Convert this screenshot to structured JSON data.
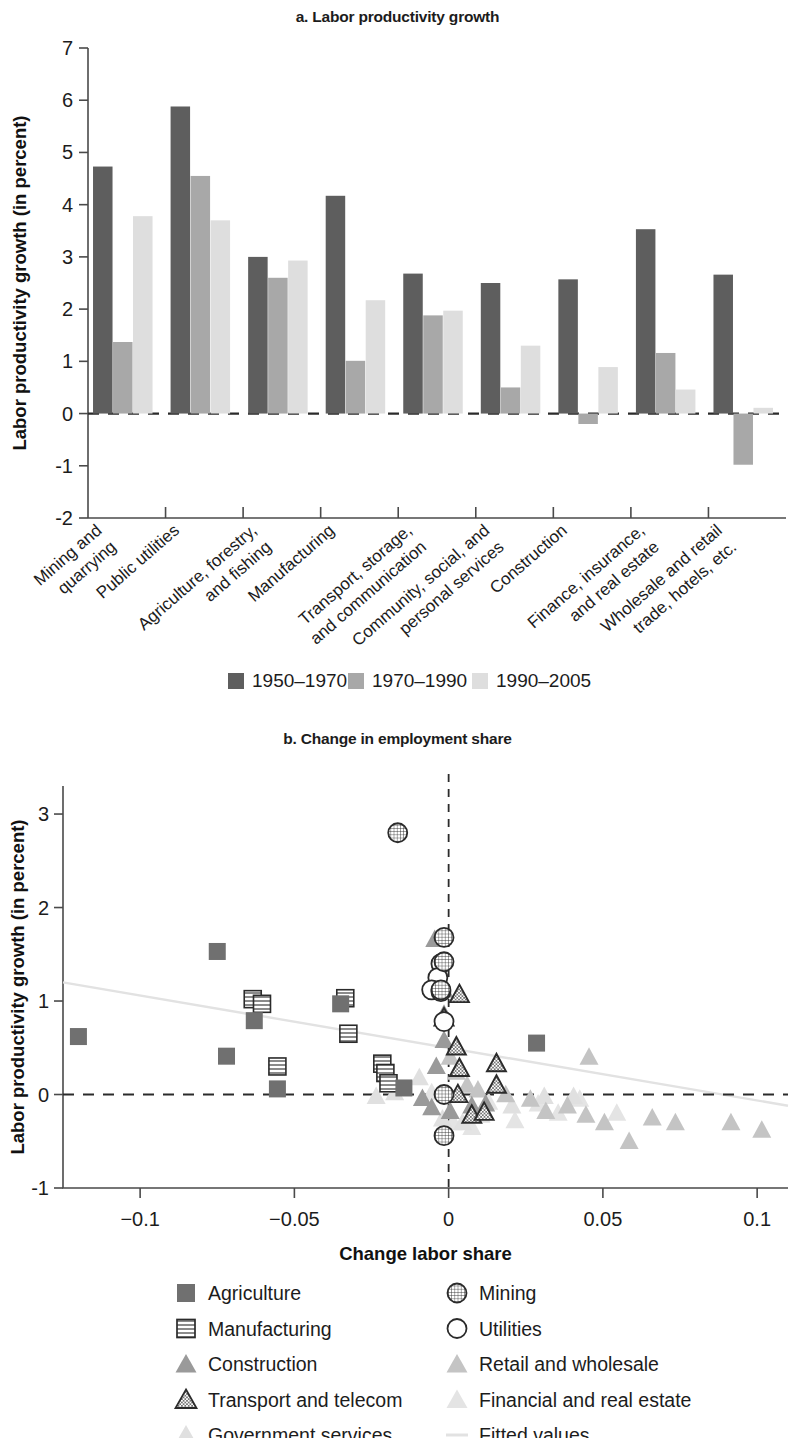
{
  "panel_a": {
    "title": "a. Labor productivity growth",
    "ylabel": "Labor productivity growth (in percent)",
    "yticks": [
      "7",
      "6",
      "5",
      "4",
      "3",
      "2",
      "1",
      "0",
      "-1",
      "-2"
    ],
    "legend": [
      {
        "label": "1950–1970",
        "color": "#5e5e5e"
      },
      {
        "label": "1970–1990",
        "color": "#a8a8a8"
      },
      {
        "label": "1990–2005",
        "color": "#dedede"
      }
    ]
  },
  "panel_b": {
    "title": "b. Change in employment share",
    "ylabel": "Labor productivity growth (in percent)",
    "xlabel": "Change labor share",
    "yticks": [
      "3",
      "2",
      "1",
      "0",
      "-1"
    ],
    "xticks": [
      "−0.1",
      "−0.05",
      "0",
      "0.05",
      "0.1"
    ],
    "legend_left": [
      {
        "label": "Agriculture",
        "marker": "filled-square",
        "color": "#707070"
      },
      {
        "label": "Manufacturing",
        "marker": "lined-square",
        "color": "#2b2b2b"
      },
      {
        "label": "Construction",
        "marker": "filled-triangle",
        "color": "#9a9a9a"
      },
      {
        "label": "Transport and telecom",
        "marker": "outline-triangle",
        "color": "#2b2b2b"
      },
      {
        "label": "Government services",
        "marker": "faint-triangle",
        "color": "#e0e0e0"
      }
    ],
    "legend_right": [
      {
        "label": "Mining",
        "marker": "globe-circle",
        "color": "#2b2b2b"
      },
      {
        "label": "Utilities",
        "marker": "open-circle",
        "color": "#2b2b2b"
      },
      {
        "label": "Retail and wholesale",
        "marker": "light-triangle",
        "color": "#c4c4c4"
      },
      {
        "label": "Financial and real estate",
        "marker": "faint-triangle",
        "color": "#e4e4e4"
      },
      {
        "label": "Fitted values",
        "marker": "line",
        "color": "#e2e2e2"
      }
    ]
  },
  "chart_data": [
    {
      "type": "bar",
      "title": "a. Labor productivity growth",
      "xlabel": "",
      "ylabel": "Labor productivity growth (in percent)",
      "ylim": [
        -2,
        7
      ],
      "grid": false,
      "legend_position": "bottom",
      "categories": [
        "Mining and quarrying",
        "Public utilities",
        "Agriculture, forestry, and fishing",
        "Manufacturing",
        "Transport, storage, and communication",
        "Community, social, and personal services",
        "Construction",
        "Finance, insurance, and real estate",
        "Wholesale and retail trade, hotels, etc."
      ],
      "series": [
        {
          "name": "1950–1970",
          "color": "#5e5e5e",
          "values": [
            4.73,
            5.88,
            3.0,
            4.17,
            2.68,
            2.5,
            2.57,
            3.53,
            2.66
          ]
        },
        {
          "name": "1970–1990",
          "color": "#a8a8a8",
          "values": [
            1.37,
            4.55,
            2.6,
            1.01,
            1.88,
            0.5,
            -0.2,
            1.16,
            -0.98
          ]
        },
        {
          "name": "1990–2005",
          "color": "#dedede",
          "values": [
            3.78,
            3.7,
            2.93,
            2.17,
            1.97,
            1.3,
            0.89,
            0.46,
            0.11
          ]
        }
      ]
    },
    {
      "type": "scatter",
      "title": "b. Change in employment share",
      "xlabel": "Change labor share",
      "ylabel": "Labor productivity growth (in percent)",
      "xlim": [
        -0.125,
        0.11
      ],
      "ylim": [
        -1.0,
        3.3
      ],
      "grid": false,
      "legend_position": "bottom",
      "annotations": [
        "horizontal dashed line at y=0",
        "vertical dashed line at x=0"
      ],
      "fitted_line": {
        "name": "Fitted values",
        "x": [
          -0.125,
          0.11
        ],
        "y": [
          1.2,
          -0.12
        ],
        "color": "#e2e2e2"
      },
      "series": [
        {
          "name": "Agriculture",
          "marker": "filled-square",
          "color": "#707070",
          "points": [
            [
              -0.12,
              0.62
            ],
            [
              -0.075,
              1.53
            ],
            [
              -0.072,
              0.41
            ],
            [
              -0.063,
              0.79
            ],
            [
              -0.0555,
              0.06
            ],
            [
              -0.035,
              0.97
            ],
            [
              -0.0145,
              0.07
            ],
            [
              0.0285,
              0.55
            ]
          ]
        },
        {
          "name": "Manufacturing",
          "marker": "lined-square",
          "color": "#2b2b2b",
          "points": [
            [
              -0.0635,
              1.02
            ],
            [
              -0.0605,
              0.97
            ],
            [
              -0.0555,
              0.3
            ],
            [
              -0.0335,
              1.03
            ],
            [
              -0.0325,
              0.65
            ],
            [
              -0.0215,
              0.33
            ],
            [
              -0.0205,
              0.23
            ],
            [
              -0.0195,
              0.12
            ]
          ]
        },
        {
          "name": "Construction",
          "marker": "filled-triangle",
          "color": "#9a9a9a",
          "points": [
            [
              -0.0045,
              1.66
            ],
            [
              -0.0015,
              1.12
            ],
            [
              -0.0015,
              0.86
            ],
            [
              -0.0015,
              0.58
            ],
            [
              -0.004,
              0.3
            ],
            [
              -0.0085,
              -0.04
            ],
            [
              -0.0055,
              -0.14
            ],
            [
              0.0005,
              -0.18
            ],
            [
              0.0075,
              -0.12
            ],
            [
              0.012,
              -0.1
            ]
          ]
        },
        {
          "name": "Transport and telecom",
          "marker": "outline-triangle",
          "color": "#2b2b2b",
          "points": [
            [
              0.0035,
              1.07
            ],
            [
              -0.0015,
              0.82
            ],
            [
              0.0025,
              0.51
            ],
            [
              0.0035,
              0.28
            ],
            [
              0.0155,
              0.33
            ],
            [
              0.0155,
              0.1
            ],
            [
              0.003,
              0.0
            ],
            [
              0.0075,
              -0.22
            ],
            [
              0.0115,
              -0.19
            ]
          ]
        },
        {
          "name": "Mining",
          "marker": "globe-circle",
          "color": "#2b2b2b",
          "points": [
            [
              -0.0165,
              2.8
            ],
            [
              -0.0015,
              1.68
            ],
            [
              -0.0015,
              1.42
            ],
            [
              -0.0025,
              1.12
            ],
            [
              -0.0015,
              0.0
            ],
            [
              -0.0015,
              -0.44
            ]
          ]
        },
        {
          "name": "Utilities",
          "marker": "open-circle",
          "color": "#2b2b2b",
          "points": [
            [
              -0.0025,
              1.4
            ],
            [
              -0.0035,
              1.25
            ],
            [
              -0.0055,
              1.12
            ],
            [
              -0.0025,
              1.1
            ],
            [
              -0.0015,
              0.78
            ]
          ]
        },
        {
          "name": "Retail and wholesale",
          "marker": "light-triangle",
          "color": "#c4c4c4",
          "points": [
            [
              0.0005,
              0.4
            ],
            [
              0.0025,
              0.24
            ],
            [
              0.006,
              0.1
            ],
            [
              0.0095,
              0.05
            ],
            [
              0.0185,
              0.0
            ],
            [
              0.0265,
              -0.05
            ],
            [
              0.0315,
              -0.18
            ],
            [
              0.0385,
              -0.12
            ],
            [
              0.0455,
              0.4
            ],
            [
              0.0445,
              -0.22
            ],
            [
              0.0505,
              -0.3
            ],
            [
              0.0585,
              -0.5
            ],
            [
              0.066,
              -0.25
            ],
            [
              0.0735,
              -0.3
            ],
            [
              0.0915,
              -0.3
            ],
            [
              0.1015,
              -0.38
            ]
          ]
        },
        {
          "name": "Financial and real estate",
          "marker": "faint-triangle",
          "color": "#e4e4e4",
          "points": [
            [
              -0.0055,
              0.02
            ],
            [
              0.0015,
              -0.3
            ],
            [
              0.0075,
              -0.35
            ],
            [
              0.013,
              -0.08
            ],
            [
              0.0215,
              -0.28
            ],
            [
              0.029,
              -0.1
            ],
            [
              0.0355,
              -0.2
            ],
            [
              0.0425,
              -0.05
            ],
            [
              0.0545,
              -0.2
            ]
          ]
        },
        {
          "name": "Government services",
          "marker": "faint-triangle",
          "color": "#e0e0e0",
          "points": [
            [
              -0.0235,
              -0.02
            ],
            [
              -0.0175,
              0.02
            ],
            [
              -0.0095,
              0.18
            ],
            [
              -0.002,
              -0.26
            ],
            [
              0.0045,
              -0.3
            ],
            [
              0.0105,
              -0.22
            ],
            [
              0.0205,
              -0.12
            ],
            [
              0.031,
              -0.02
            ],
            [
              0.0405,
              -0.02
            ]
          ]
        }
      ]
    }
  ]
}
